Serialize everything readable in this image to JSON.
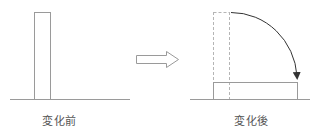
{
  "diagram": {
    "type": "state-change-illustration",
    "panels": [
      {
        "id": "before",
        "label": "変化前",
        "shapes": [
          {
            "kind": "baseline",
            "x1": 10,
            "y1": 99,
            "x2": 130,
            "y2": 99
          },
          {
            "kind": "rectangle",
            "orientation": "upright",
            "x": 34,
            "y": 12,
            "width": 16,
            "height": 87
          }
        ]
      },
      {
        "id": "after",
        "label": "変化後",
        "shapes": [
          {
            "kind": "baseline",
            "x1": 190,
            "y1": 99,
            "x2": 310,
            "y2": 99
          },
          {
            "kind": "ghost-rectangle",
            "style": "dashed",
            "x": 213,
            "y": 12,
            "width": 16,
            "height": 87
          },
          {
            "kind": "rectangle",
            "orientation": "fallen",
            "x": 213,
            "y": 82,
            "width": 84,
            "height": 17
          },
          {
            "kind": "rotation-arrow",
            "style": "arc",
            "from": [
              229,
              12
            ],
            "to": [
              297,
              80
            ],
            "direction": "clockwise"
          }
        ]
      }
    ],
    "transition_arrow": {
      "kind": "hollow-block-arrow",
      "x": 136,
      "y": 51,
      "width": 42,
      "height": 16,
      "direction": "right"
    },
    "colors": {
      "line": "#9a9a9a",
      "dashed": "#b5b5b5",
      "arrow": "#333333",
      "label": "#555555",
      "background": "#ffffff"
    }
  }
}
